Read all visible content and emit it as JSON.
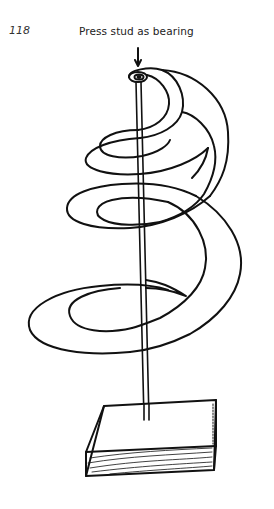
{
  "page": {
    "number": "118"
  },
  "figure": {
    "label": "Press stud as bearing",
    "colors": {
      "ink": "#111111",
      "paper": "#ffffff"
    }
  }
}
